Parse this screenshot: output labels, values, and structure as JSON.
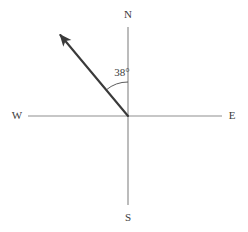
{
  "figure": {
    "type": "compass-bearing-diagram",
    "background_color": "#ffffff"
  },
  "chart_data": {
    "type": "scatter",
    "title": "",
    "subtitle": "",
    "xlabel": "",
    "ylabel": "",
    "grid": false,
    "legend": null,
    "origin": {
      "x": 128,
      "y": 116
    },
    "axes": [
      {
        "name": "vertical-axis",
        "from": {
          "x": 128,
          "y": 27
        },
        "to": {
          "x": 128,
          "y": 205
        },
        "color": "#8f8f8f",
        "width": 1.2
      },
      {
        "name": "horizontal-axis",
        "from": {
          "x": 28,
          "y": 116
        },
        "to": {
          "x": 222,
          "y": 116
        },
        "color": "#8f8f8f",
        "width": 1.2
      }
    ],
    "cardinal_labels": [
      {
        "id": "north",
        "text": "N",
        "x": 128,
        "y": 15
      },
      {
        "id": "south",
        "text": "S",
        "x": 128,
        "y": 218
      },
      {
        "id": "west",
        "text": "W",
        "x": 17,
        "y": 116
      },
      {
        "id": "east",
        "text": "E",
        "x": 232,
        "y": 116
      }
    ],
    "ray": {
      "name": "bearing-ray",
      "from": {
        "x": 128,
        "y": 116
      },
      "to": {
        "x": 57,
        "y": 31
      },
      "color": "#3a3a3a",
      "width": 2.1,
      "arrowhead": true,
      "quadrant": "north-west"
    },
    "angle": {
      "value": 38,
      "unit": "degrees",
      "label": "38°",
      "label_x": 122,
      "label_y": 73,
      "measured_from": "N",
      "measured_to": "bearing-ray",
      "arc_radius": 34,
      "arc_color": "#4a4a4a"
    }
  },
  "colors": {
    "background": "#ffffff",
    "axis": "#8f8f8f",
    "ray": "#3a3a3a",
    "text": "#3b3b3b",
    "arc": "#4a4a4a"
  }
}
